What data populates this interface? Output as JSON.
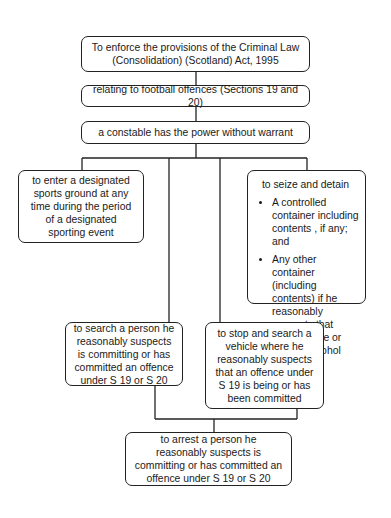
{
  "diagram": {
    "nodes": {
      "root": {
        "line1": "To enforce the provisions of the Criminal Law",
        "line2": "(Consolidation) (Scotland) Act, 1995"
      },
      "scope": {
        "text": "relating to football offences (Sections 19 and 20)"
      },
      "power": {
        "text": "a constable has the power without warrant"
      },
      "enter": {
        "text": "to enter a designated sports ground at any time during the period of a designated sporting event"
      },
      "seize": {
        "title": "to seize and detain",
        "items": [
          "A controlled container including contents , if any; and",
          "Any other container (including contents) if he reasonably suspects that contents are or include alcohol"
        ]
      },
      "search_person": {
        "text": "to search a person he reasonably suspects is committing or has committed an offence under S 19 or S 20"
      },
      "search_vehicle": {
        "text": "to stop and search a vehicle where he reasonably suspects that an offence under S 19 is being or has been committed"
      },
      "arrest": {
        "text": "to arrest a person he reasonably suspects is committing or has committed an offence under S 19 or S 20"
      }
    },
    "edges": [
      [
        "root",
        "scope"
      ],
      [
        "scope",
        "power"
      ],
      [
        "power",
        "enter"
      ],
      [
        "power",
        "search_person"
      ],
      [
        "power",
        "search_vehicle"
      ],
      [
        "power",
        "seize"
      ],
      [
        "search_person",
        "arrest"
      ],
      [
        "search_vehicle",
        "arrest"
      ]
    ]
  }
}
